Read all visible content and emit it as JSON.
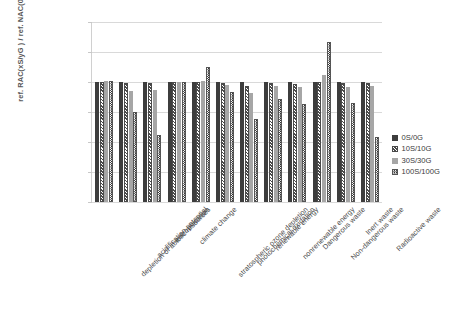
{
  "chart_data": {
    "type": "bar",
    "title": "",
    "xlabel": "",
    "ylabel": "ref. RAC(xS/yG ) /  ref. NAC(0S/0G)",
    "ylim": [
      0.8,
      1.1
    ],
    "ytick_labels": [
      "1,10",
      "1,05",
      "1,00",
      "0,95",
      "0,90",
      "0,85",
      "0,80"
    ],
    "ytick_values": [
      1.1,
      1.05,
      1.0,
      0.95,
      0.9,
      0.85,
      0.8
    ],
    "grid": true,
    "legend_position": "right",
    "categories": [
      "depletion of abiotic resources",
      "acidification potential",
      "eutrophication",
      "climate change",
      "stratospheric ozone depletion",
      "photochemical oxidation",
      "renewable energy",
      "nonrenewable energy",
      "Dangerous waste",
      "Non-dangerous waste",
      "Inert waste",
      "Radioactive waste"
    ],
    "series": [
      {
        "name": "0S/0G",
        "pattern": "solid-dark",
        "color": "#3d3d3d",
        "values": [
          1.0,
          1.0,
          1.0,
          1.0,
          1.0,
          1.0,
          1.0,
          1.0,
          1.0,
          1.0,
          1.0,
          1.0
        ]
      },
      {
        "name": "10S/10G",
        "pattern": "diagonal-hatch",
        "color": "#4a4a4a",
        "values": [
          1.0,
          0.998,
          0.998,
          1.0,
          1.0,
          0.998,
          0.994,
          0.999,
          0.997,
          1.0,
          0.999,
          0.998
        ]
      },
      {
        "name": "30S/30G",
        "pattern": "solid-gray",
        "color": "#a6a6a6",
        "values": [
          1.001,
          0.985,
          0.986,
          1.0,
          1.002,
          0.995,
          0.982,
          0.993,
          0.991,
          1.011,
          0.991,
          0.994
        ]
      },
      {
        "name": "100S/100G",
        "pattern": "checker",
        "color": "#2f2f2f",
        "values": [
          1.002,
          0.95,
          0.911,
          1.0,
          1.025,
          0.984,
          0.939,
          0.972,
          0.964,
          1.067,
          0.965,
          0.909
        ]
      }
    ],
    "legend": [
      "0S/0G",
      "10S/10G",
      "30S/30G",
      "100S/100G"
    ]
  }
}
